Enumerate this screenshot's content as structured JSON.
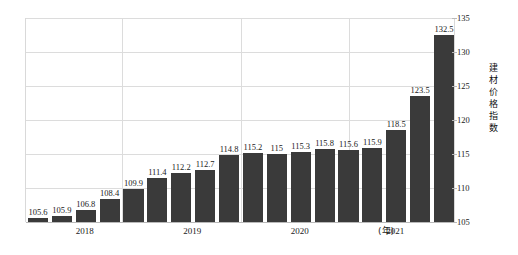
{
  "chart_data": {
    "type": "bar",
    "title": "",
    "subtitle": "",
    "xlabel": "(年)",
    "ylabel": "建材价格指数",
    "ylim": [
      105,
      135
    ],
    "ytick_values": [
      105,
      110,
      115,
      120,
      125,
      130,
      135
    ],
    "ytick_labels": [
      "105",
      "110",
      "115",
      "120",
      "125",
      "130",
      "135"
    ],
    "grid": true,
    "legend": "none",
    "y_axis_position": "right",
    "bar_color": "#3a3a3a",
    "grid_color": "#dcdcdc",
    "categories": [
      "1",
      "2",
      "3",
      "4",
      "5",
      "6",
      "7",
      "8",
      "9",
      "10",
      "11",
      "12",
      "13",
      "14",
      "15",
      "16",
      "17",
      "18"
    ],
    "values": [
      105.6,
      105.9,
      106.8,
      108.4,
      109.9,
      111.4,
      112.2,
      112.7,
      114.8,
      115.2,
      115,
      115.3,
      115.8,
      115.6,
      115.9,
      118.5,
      123.5,
      132.5
    ],
    "data_labels": [
      "105.6",
      "105.9",
      "106.8",
      "108.4",
      "109.9",
      "111.4",
      "112.2",
      "112.7",
      "114.8",
      "115.2",
      "115",
      "115.3",
      "115.8",
      "115.6",
      "115.9",
      "118.5",
      "123.5",
      "132.5"
    ],
    "x_groups": [
      {
        "label": "2018",
        "center_index": 2
      },
      {
        "label": "2019",
        "center_index": 6.5
      },
      {
        "label": "2020",
        "center_index": 11
      },
      {
        "label": "2021",
        "center_index": 15
      }
    ],
    "group_boundaries": [
      4.0,
      9.0,
      13.5
    ]
  },
  "figure": {
    "caption": ""
  }
}
